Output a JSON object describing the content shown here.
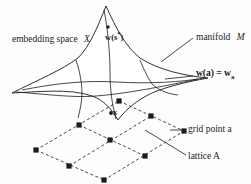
{
  "figure": {
    "type": "manifold-lattice-diagram",
    "background_color": "#fdfdfd",
    "ink_color": "#1b1b1b",
    "labels": {
      "embedding_space": "embedding space",
      "embedding_space_symbol": "X",
      "w_star_prefix": "w(s",
      "w_star_sup": "*",
      "w_star_suffix": ")",
      "manifold": "manifold",
      "manifold_symbol": "M",
      "w_of_a_lhs": "w(a) = w",
      "w_of_a_sub": "a",
      "point_x": "x",
      "grid_point": "grid point a",
      "lattice": "lattice A"
    }
  },
  "geometry": {
    "manifold_outline": "M 12,93 C 38,80 62,70 78,58 C 90,46 98,26 106,6 C 116,28 125,46 140,58 C 158,70 186,76 208,78 C 186,82 160,88 146,96 C 132,104 124,112 118,120 C 112,110 104,100 92,96 C 70,88 36,92 12,93 Z",
    "manifold_curve_h1": "M 22,90 C 52,84 84,80 116,82 C 150,84 182,82 204,78",
    "manifold_curve_h2": "M 16,92 C 44,94 74,98 96,96 C 124,94 166,86 198,79",
    "manifold_curve_v1": "M 76,60 C 80,72 82,84 82,93 C 82,102 80,110 78,118",
    "manifold_curve_v2": "M 104,10 C 108,30 110,54 110,72 C 110,90 112,104 116,119",
    "manifold_curve_v3": "M 140,60 C 144,70 148,78 152,84 C 158,90 168,94 178,95",
    "lattice_points": [
      {
        "id": "p00",
        "x": 36,
        "y": 150,
        "label": null
      },
      {
        "id": "p01",
        "x": 79,
        "y": 125,
        "label": null
      },
      {
        "id": "p02",
        "x": 119,
        "y": 101,
        "label": null
      },
      {
        "id": "p10",
        "x": 69,
        "y": 166,
        "label": null
      },
      {
        "id": "p11",
        "x": 110,
        "y": 140,
        "label": null
      },
      {
        "id": "p12",
        "x": 151,
        "y": 116,
        "label": null
      },
      {
        "id": "p20",
        "x": 104,
        "y": 180,
        "label": null
      },
      {
        "id": "p21",
        "x": 145,
        "y": 156,
        "label": null
      },
      {
        "id": "p22",
        "x": 184,
        "y": 131,
        "label": "grid point a"
      }
    ],
    "lattice_edges": [
      [
        36,
        150,
        119,
        101
      ],
      [
        69,
        166,
        151,
        116
      ],
      [
        104,
        180,
        184,
        131
      ],
      [
        36,
        150,
        104,
        180
      ],
      [
        79,
        125,
        145,
        156
      ],
      [
        119,
        101,
        184,
        131
      ]
    ],
    "point_x": {
      "x": 111,
      "y": 113
    },
    "point_w_star": {
      "x": 108,
      "y": 27
    },
    "leaders": [
      {
        "name": "manifold-leader",
        "x1": 193,
        "y1": 38,
        "x2": 161,
        "y2": 62
      },
      {
        "name": "w-of-a-leader",
        "x1": 193,
        "y1": 76,
        "x2": 165,
        "y2": 79
      },
      {
        "name": "grid-point-leader",
        "x1": 186,
        "y1": 130,
        "x2": 170,
        "y2": 130
      },
      {
        "name": "lattice-leader",
        "x1": 186,
        "y1": 155,
        "x2": 145,
        "y2": 130
      }
    ]
  }
}
